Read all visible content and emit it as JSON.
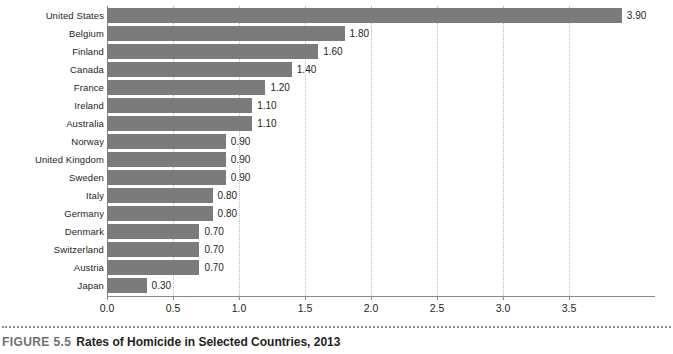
{
  "caption": {
    "figure_number": "FIGURE 5.5",
    "title": "Rates of Homicide in Selected Countries, 2013"
  },
  "colors": {
    "bar": "#7b7b7b",
    "axis": "#8a8a8a",
    "gridline": "#bdbdbd",
    "text": "#231f20",
    "figure_number": "#6f6f6f",
    "background": "#ffffff"
  },
  "chart_data": {
    "type": "bar",
    "orientation": "horizontal",
    "title": "Rates of Homicide in Selected Countries, 2013",
    "xlabel": "",
    "ylabel": "",
    "xlim": [
      0.0,
      4.15
    ],
    "grid": true,
    "legend": "none",
    "xticks": [
      "0.0",
      "0.5",
      "1.0",
      "1.5",
      "2.0",
      "2.5",
      "3.0",
      "3.5"
    ],
    "xtick_values": [
      0.0,
      0.5,
      1.0,
      1.5,
      2.0,
      2.5,
      3.0,
      3.5
    ],
    "categories": [
      "United States",
      "Belgium",
      "Finland",
      "Canada",
      "France",
      "Ireland",
      "Australia",
      "Norway",
      "United Kingdom",
      "Sweden",
      "Italy",
      "Germany",
      "Denmark",
      "Switzerland",
      "Austria",
      "Japan"
    ],
    "values": [
      3.9,
      1.8,
      1.6,
      1.4,
      1.2,
      1.1,
      1.1,
      0.9,
      0.9,
      0.9,
      0.8,
      0.8,
      0.7,
      0.7,
      0.7,
      0.3
    ],
    "value_labels": [
      "3.90",
      "1.80",
      "1.60",
      "1.40",
      "1.20",
      "1.10",
      "1.10",
      "0.90",
      "0.90",
      "0.90",
      "0.80",
      "0.80",
      "0.70",
      "0.70",
      "0.70",
      "0.30"
    ]
  }
}
